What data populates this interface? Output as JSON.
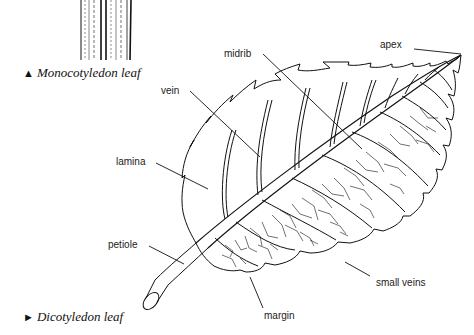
{
  "figure": {
    "monocot_caption": "Monocotyledon leaf",
    "monocot_marker": "▲",
    "dicot_caption": "Dicotyledon leaf",
    "dicot_marker": "►"
  },
  "labels": {
    "apex": "apex",
    "midrib": "midrib",
    "vein": "vein",
    "lamina": "lamina",
    "petiole": "petiole",
    "small_veins": "small veins",
    "margin": "margin"
  },
  "colors": {
    "ink": "#111111",
    "label_text": "#222222",
    "background": "#ffffff"
  }
}
